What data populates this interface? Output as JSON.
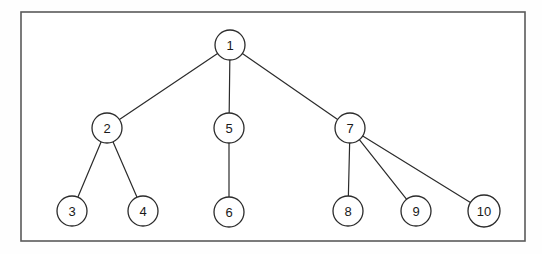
{
  "figure": {
    "kind": "tree-diagram",
    "title": "",
    "background_color": "#fefefe",
    "frame": {
      "label": "diagram-border",
      "x": 21,
      "y": 12,
      "width": 504,
      "height": 229,
      "stroke_color": "#5a5a5a",
      "stroke_width": 1.6,
      "fill_color": "#ffffff"
    },
    "style": {
      "node_stroke_color": "#2b2b2b",
      "node_stroke_width": 1.3,
      "node_fill_color": "#ffffff",
      "node_radius": 15,
      "edge_stroke_color": "#2b2b2b",
      "edge_stroke_width": 1.2,
      "label_color": "#1a1a1a",
      "label_font_size": 13
    },
    "nodes": [
      {
        "id": "n1",
        "label": "1",
        "cx": 230,
        "cy": 45,
        "r": 15
      },
      {
        "id": "n2",
        "label": "2",
        "cx": 107,
        "cy": 128,
        "r": 15
      },
      {
        "id": "n5",
        "label": "5",
        "cx": 229,
        "cy": 128,
        "r": 15
      },
      {
        "id": "n7",
        "label": "7",
        "cx": 350,
        "cy": 128,
        "r": 15
      },
      {
        "id": "n3",
        "label": "3",
        "cx": 72,
        "cy": 211,
        "r": 15
      },
      {
        "id": "n4",
        "label": "4",
        "cx": 143,
        "cy": 211,
        "r": 15
      },
      {
        "id": "n6",
        "label": "6",
        "cx": 229,
        "cy": 212,
        "r": 15
      },
      {
        "id": "n8",
        "label": "8",
        "cx": 348,
        "cy": 211,
        "r": 15
      },
      {
        "id": "n9",
        "label": "9",
        "cx": 416,
        "cy": 211,
        "r": 15
      },
      {
        "id": "n10",
        "label": "10",
        "cx": 484,
        "cy": 211,
        "r": 16
      }
    ],
    "edges": [
      {
        "id": "e1-2",
        "from": "n1",
        "to": "n2"
      },
      {
        "id": "e1-5",
        "from": "n1",
        "to": "n5"
      },
      {
        "id": "e1-7",
        "from": "n1",
        "to": "n7"
      },
      {
        "id": "e2-3",
        "from": "n2",
        "to": "n3"
      },
      {
        "id": "e2-4",
        "from": "n2",
        "to": "n4"
      },
      {
        "id": "e5-6",
        "from": "n5",
        "to": "n6"
      },
      {
        "id": "e7-8",
        "from": "n7",
        "to": "n8"
      },
      {
        "id": "e7-9",
        "from": "n7",
        "to": "n9"
      },
      {
        "id": "e7-10",
        "from": "n7",
        "to": "n10"
      }
    ]
  }
}
